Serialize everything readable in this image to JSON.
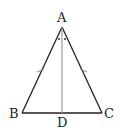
{
  "diagram": {
    "type": "isosceles-triangle",
    "points": {
      "A": {
        "label": "A",
        "x": 62,
        "y": 27
      },
      "B": {
        "label": "B",
        "x": 22,
        "y": 113
      },
      "C": {
        "label": "C",
        "x": 102,
        "y": 113
      },
      "D": {
        "label": "D",
        "x": 62,
        "y": 113
      }
    },
    "segments": [
      {
        "from": "A",
        "to": "B",
        "tick_marks": 1
      },
      {
        "from": "A",
        "to": "C",
        "tick_marks": 1
      },
      {
        "from": "B",
        "to": "C",
        "tick_marks": 0
      },
      {
        "from": "A",
        "to": "D",
        "tick_marks": 0,
        "style": "light"
      }
    ],
    "angle_marks": [
      {
        "vertex": "A",
        "between": [
          "B",
          "D"
        ],
        "mark": "dot"
      },
      {
        "vertex": "A",
        "between": [
          "D",
          "C"
        ],
        "mark": "dot"
      }
    ],
    "colors": {
      "line": "#222222",
      "median": "#999999"
    }
  }
}
